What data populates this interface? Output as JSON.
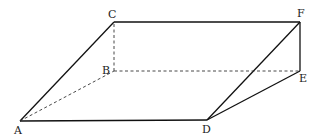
{
  "diagram": {
    "points": {
      "A": {
        "x": 20,
        "y": 121,
        "label": "A"
      },
      "B": {
        "x": 114,
        "y": 71,
        "label": "B"
      },
      "C": {
        "x": 114,
        "y": 22,
        "label": "C"
      },
      "D": {
        "x": 207,
        "y": 120,
        "label": "D"
      },
      "E": {
        "x": 300,
        "y": 71,
        "label": "E"
      },
      "F": {
        "x": 300,
        "y": 22,
        "label": "F"
      }
    },
    "solid_edges": [
      [
        "A",
        "C"
      ],
      [
        "C",
        "F"
      ],
      [
        "F",
        "E"
      ],
      [
        "A",
        "D"
      ],
      [
        "D",
        "F"
      ],
      [
        "D",
        "E"
      ]
    ],
    "dashed_edges": [
      [
        "A",
        "B"
      ],
      [
        "B",
        "C"
      ],
      [
        "B",
        "E"
      ]
    ]
  }
}
